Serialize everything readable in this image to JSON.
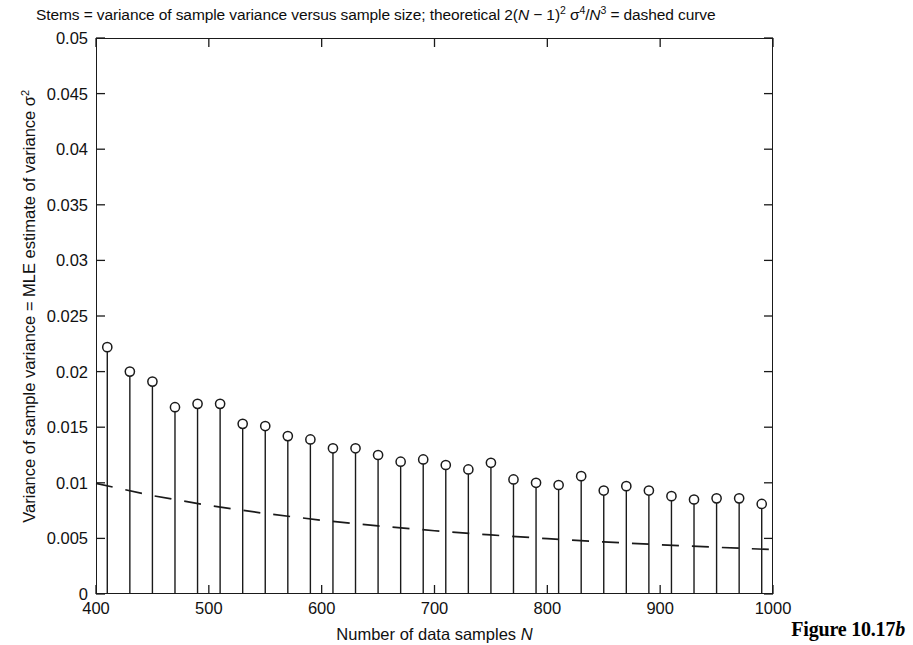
{
  "caption": {
    "prefix": "Stems = variance of sample variance versus sample size; theoretical 2(",
    "var_n": "N",
    "mid1": " − 1)",
    "exp1": "2",
    "sigma": " σ",
    "exp2": "4",
    "slash": "/",
    "var_n2": "N",
    "exp3": "3",
    "suffix": " = dashed curve"
  },
  "figure_label": {
    "text": "Figure 10.17",
    "italic_suffix": "b"
  },
  "axis_labels": {
    "xlabel_prefix": "Number of data samples ",
    "xlabel_var": "N",
    "ylabel_prefix": "Variance of sample variance = MLE estimate of variance σ",
    "ylabel_exp": "2"
  },
  "colors": {
    "axis": "#1a1a1a",
    "stem": "#1a1a1a",
    "marker_stroke": "#1a1a1a",
    "marker_fill": "#ffffff",
    "theory": "#1a1a1a",
    "background": "#ffffff",
    "text": "#111111"
  },
  "chart_data": {
    "type": "line",
    "xlabel": "Number of data samples N",
    "ylabel": "Variance of sample variance = MLE estimate of variance σ²",
    "xlim": [
      400,
      1000
    ],
    "ylim": [
      0,
      0.05
    ],
    "xticks": [
      400,
      500,
      600,
      700,
      800,
      900,
      1000
    ],
    "xtick_labels": [
      "400",
      "500",
      "600",
      "700",
      "800",
      "900",
      "1000"
    ],
    "yticks": [
      0,
      0.005,
      0.01,
      0.015,
      0.02,
      0.025,
      0.03,
      0.035,
      0.04,
      0.045,
      0.05
    ],
    "ytick_labels": [
      "0",
      "0.005",
      "0.01",
      "0.015",
      "0.02",
      "0.025",
      "0.03",
      "0.035",
      "0.04",
      "0.045",
      "0.05"
    ],
    "grid": false,
    "legend": null,
    "series": [
      {
        "name": "Stems = variance of sample variance (empirical)",
        "type": "stem",
        "marker": "circle-open",
        "x": [
          410,
          430,
          450,
          470,
          490,
          510,
          530,
          550,
          570,
          590,
          610,
          630,
          650,
          670,
          690,
          710,
          730,
          750,
          770,
          790,
          810,
          830,
          850,
          870,
          890,
          910,
          930,
          950,
          970,
          990
        ],
        "values": [
          0.0222,
          0.02,
          0.0191,
          0.0168,
          0.0171,
          0.0171,
          0.0153,
          0.0151,
          0.0142,
          0.0139,
          0.0131,
          0.0131,
          0.0125,
          0.0119,
          0.0121,
          0.0116,
          0.0112,
          0.0118,
          0.0103,
          0.01,
          0.0098,
          0.0106,
          0.0093,
          0.0097,
          0.0093,
          0.0088,
          0.0085,
          0.0086,
          0.0086,
          0.0081
        ]
      },
      {
        "name": "theoretical 2(N−1)² σ⁴/N³",
        "type": "line-dashed",
        "x": [
          400,
          450,
          500,
          550,
          600,
          650,
          700,
          750,
          800,
          850,
          900,
          950,
          1000
        ],
        "values": [
          0.00995,
          0.00885,
          0.00796,
          0.00724,
          0.00663,
          0.00612,
          0.00569,
          0.00531,
          0.00498,
          0.00468,
          0.00443,
          0.0042,
          0.00399
        ]
      }
    ]
  }
}
